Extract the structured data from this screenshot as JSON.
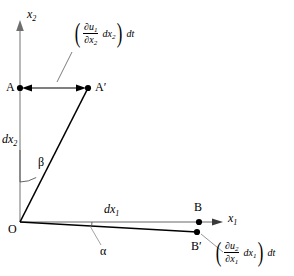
{
  "figure": {
    "background_color": "#ffffff",
    "axis_color": "#9a9a9a",
    "line_color": "#000000"
  },
  "axes": {
    "vertical": {
      "name": "x2",
      "label_main": "x",
      "label_sub": "2"
    },
    "horizontal": {
      "name": "x1",
      "label_main": "x",
      "label_sub": "1"
    }
  },
  "points": {
    "origin": {
      "label": "O",
      "x": 20,
      "y": 222
    },
    "A": {
      "label": "A",
      "x": 20,
      "y": 88
    },
    "A_prime": {
      "label": "A′",
      "x": 88,
      "y": 88
    },
    "B": {
      "label": "B",
      "x": 199,
      "y": 222
    },
    "B_prime": {
      "label": "B′",
      "x": 197,
      "y": 232
    }
  },
  "dimensions": {
    "dx2": {
      "main": "dx",
      "sub": "2"
    },
    "dx1": {
      "main": "dx",
      "sub": "1"
    }
  },
  "angles": {
    "beta": "β",
    "alpha": "α"
  },
  "expressions": {
    "top": {
      "open_paren": "(",
      "numerator_partial": "∂u",
      "numerator_sub": "1",
      "denominator_partial": "∂x",
      "denominator_sub": "2",
      "dterm_main": "dx",
      "dterm_sub": "2",
      "close_paren": ")",
      "dt": "dt"
    },
    "bottom": {
      "open_paren": "(",
      "numerator_partial": "∂u",
      "numerator_sub": "2",
      "denominator_partial": "∂x",
      "denominator_sub": "1",
      "dterm_main": "dx",
      "dterm_sub": "1",
      "close_paren": ")",
      "dt": "dt"
    }
  }
}
